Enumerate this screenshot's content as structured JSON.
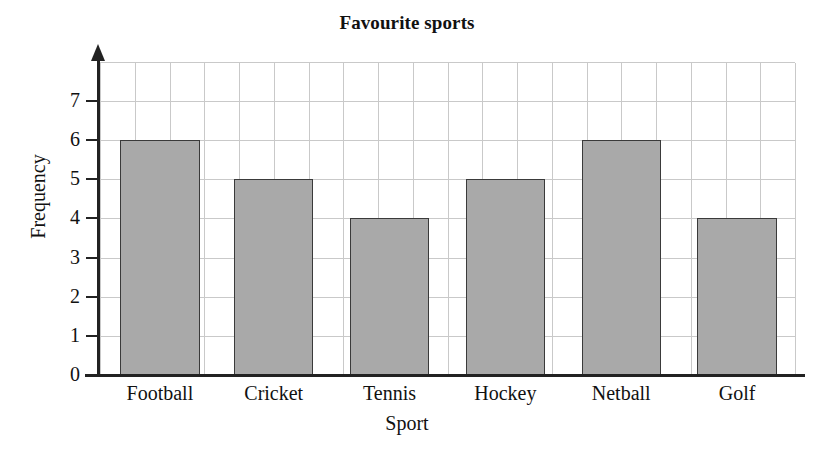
{
  "chart_data": {
    "type": "bar",
    "title": "Favourite sports",
    "xlabel": "Sport",
    "ylabel": "Frequency",
    "categories": [
      "Football",
      "Cricket",
      "Tennis",
      "Hockey",
      "Netball",
      "Golf"
    ],
    "values": [
      6,
      5,
      4,
      5,
      6,
      4
    ],
    "ylim": [
      0,
      7
    ],
    "ytick_labels": [
      "0",
      "1",
      "2",
      "3",
      "4",
      "5",
      "6",
      "7"
    ],
    "ytick_values": [
      0,
      1,
      2,
      3,
      4,
      5,
      6,
      7
    ],
    "grid": true,
    "legend": false,
    "bar_fill_color": "#a9a9a9",
    "bar_border_color": "#3a3a3a",
    "gridline_color": "#c9c9c9",
    "axis_color": "#222222",
    "background_color": "#ffffff"
  }
}
